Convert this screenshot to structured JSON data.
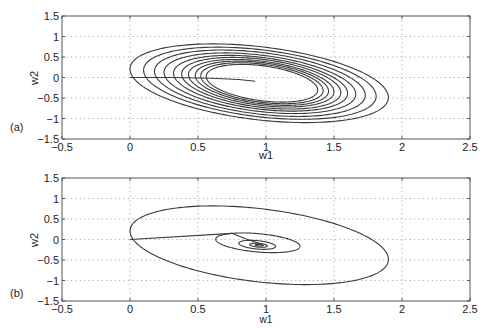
{
  "chart_data": [
    {
      "type": "line",
      "panel_label": "(a)",
      "xlabel": "w1",
      "ylabel": "w2",
      "xlim": [
        -0.5,
        2.5
      ],
      "ylim": [
        -1.5,
        1.5
      ],
      "xticks": [
        "-0.5",
        "0",
        "0.5",
        "1",
        "1.5",
        "2",
        "2.5"
      ],
      "yticks": [
        "1.5",
        "1",
        "0.5",
        "0",
        "-0.5",
        "-1",
        "-1.5"
      ],
      "xtick_values": [
        -0.5,
        0,
        0.5,
        1,
        1.5,
        2,
        2.5
      ],
      "ytick_values": [
        1.5,
        1,
        0.5,
        0,
        -0.5,
        -1,
        -1.5
      ],
      "grid": true,
      "series": [
        {
          "name": "initial-path",
          "points": [
            [
              0,
              0
            ],
            [
              0.3,
              0.0
            ],
            [
              0.6,
              -0.02
            ],
            [
              0.8,
              -0.05
            ],
            [
              0.92,
              -0.09
            ]
          ]
        },
        {
          "name": "orbit-1",
          "ellipse": {
            "center": [
              0.95,
              -0.14
            ],
            "left": 0.0,
            "right": 1.9,
            "top": 0.82,
            "bottom": -1.1
          }
        },
        {
          "name": "orbit-2",
          "ellipse": {
            "center": [
              0.955,
              -0.14
            ],
            "left": 0.1,
            "right": 1.81,
            "top": 0.74,
            "bottom": -1.02
          }
        },
        {
          "name": "orbit-3",
          "ellipse": {
            "center": [
              0.955,
              -0.14
            ],
            "left": 0.18,
            "right": 1.73,
            "top": 0.67,
            "bottom": -0.95
          }
        },
        {
          "name": "orbit-4",
          "ellipse": {
            "center": [
              0.955,
              -0.14
            ],
            "left": 0.25,
            "right": 1.66,
            "top": 0.6,
            "bottom": -0.88
          }
        },
        {
          "name": "orbit-5",
          "ellipse": {
            "center": [
              0.96,
              -0.14
            ],
            "left": 0.32,
            "right": 1.6,
            "top": 0.54,
            "bottom": -0.82
          }
        },
        {
          "name": "orbit-6",
          "ellipse": {
            "center": [
              0.965,
              -0.14
            ],
            "left": 0.38,
            "right": 1.55,
            "top": 0.49,
            "bottom": -0.77
          }
        },
        {
          "name": "orbit-7",
          "ellipse": {
            "center": [
              0.965,
              -0.14
            ],
            "left": 0.43,
            "right": 1.5,
            "top": 0.44,
            "bottom": -0.72
          }
        },
        {
          "name": "orbit-8",
          "ellipse": {
            "center": [
              0.97,
              -0.14
            ],
            "left": 0.48,
            "right": 1.46,
            "top": 0.4,
            "bottom": -0.68
          }
        },
        {
          "name": "orbit-9",
          "ellipse": {
            "center": [
              0.97,
              -0.14
            ],
            "left": 0.52,
            "right": 1.42,
            "top": 0.36,
            "bottom": -0.64
          }
        },
        {
          "name": "orbit-10",
          "ellipse": {
            "center": [
              0.97,
              -0.14
            ],
            "left": 0.56,
            "right": 1.38,
            "top": 0.32,
            "bottom": -0.6
          }
        }
      ]
    },
    {
      "type": "line",
      "panel_label": "(b)",
      "xlabel": "w1",
      "ylabel": "w2",
      "xlim": [
        -0.5,
        2.5
      ],
      "ylim": [
        -1.5,
        1.5
      ],
      "xticks": [
        "-0.5",
        "0",
        "0.5",
        "1",
        "1.5",
        "2",
        "2.5"
      ],
      "yticks": [
        "1.5",
        "1",
        "0.5",
        "0",
        "-0.5",
        "-1",
        "-1.5"
      ],
      "xtick_values": [
        -0.5,
        0,
        0.5,
        1,
        1.5,
        2,
        2.5
      ],
      "ytick_values": [
        1.5,
        1,
        0.5,
        0,
        -0.5,
        -1,
        -1.5
      ],
      "grid": true,
      "series": [
        {
          "name": "initial-path",
          "points": [
            [
              0,
              0
            ],
            [
              0.75,
              0.15
            ],
            [
              0.85,
              0.02
            ],
            [
              0.95,
              -0.1
            ]
          ]
        },
        {
          "name": "orbit-1",
          "ellipse": {
            "center": [
              0.95,
              -0.14
            ],
            "left": 0.0,
            "right": 1.9,
            "top": 0.82,
            "bottom": -1.1
          }
        },
        {
          "name": "orbit-2",
          "ellipse": {
            "center": [
              0.95,
              -0.12
            ],
            "left": 0.63,
            "right": 1.25,
            "top": 0.16,
            "bottom": -0.32
          }
        },
        {
          "name": "orbit-3",
          "ellipse": {
            "center": [
              0.95,
              -0.13
            ],
            "left": 0.8,
            "right": 1.07,
            "top": -0.02,
            "bottom": -0.24
          }
        },
        {
          "name": "orbit-4",
          "ellipse": {
            "center": [
              0.95,
              -0.14
            ],
            "left": 0.88,
            "right": 1.01,
            "top": -0.09,
            "bottom": -0.19
          }
        },
        {
          "name": "orbit-5",
          "ellipse": {
            "center": [
              0.95,
              -0.14
            ],
            "left": 0.92,
            "right": 0.98,
            "top": -0.12,
            "bottom": -0.16
          }
        }
      ]
    }
  ]
}
